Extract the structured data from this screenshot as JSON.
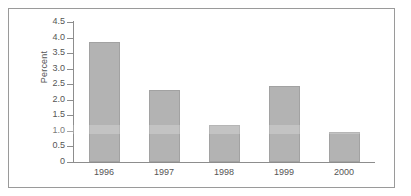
{
  "chart_data": {
    "type": "bar",
    "title": "",
    "subtitle": "",
    "xlabel": "",
    "ylabel": "Percent",
    "categories": [
      "1996",
      "1997",
      "1998",
      "1999",
      "2000"
    ],
    "values": [
      3.85,
      2.3,
      1.2,
      2.45,
      0.95
    ],
    "series": [
      {
        "name": "Percent",
        "values": [
          3.85,
          2.3,
          1.2,
          2.45,
          0.95
        ]
      }
    ],
    "ylim": [
      0,
      4.5
    ],
    "y_ticks": [
      "4.5",
      "4.0",
      "3.5",
      "3.0",
      "2.5",
      "2.0",
      "1.5",
      "1.0",
      "0.5",
      "0"
    ],
    "y_tick_values": [
      4.5,
      4.0,
      3.5,
      3.0,
      2.5,
      2.0,
      1.5,
      1.0,
      0.5,
      0
    ],
    "grid": false,
    "legend": null,
    "legend_position": "none",
    "annotations": [],
    "bar_color": "#b3b3b3",
    "bar_border_color": "#a2a2a2",
    "axis_color": "#8d8d8d",
    "text_color": "#555555",
    "frame_color": "#9a9a9a",
    "background": "#ffffff"
  }
}
